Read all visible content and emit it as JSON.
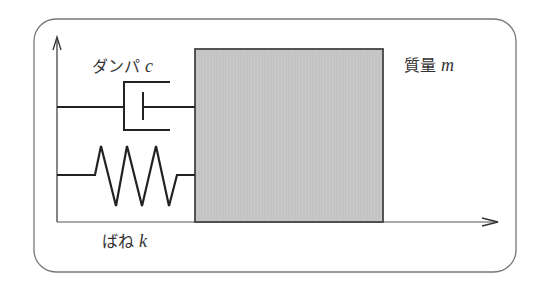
{
  "diagram": {
    "damper": {
      "label": "ダンパ",
      "symbol": "c"
    },
    "spring": {
      "label": "ばね",
      "symbol": "k"
    },
    "mass": {
      "label": "質量",
      "symbol": "m"
    },
    "colors": {
      "mass_fill": "#c8c8c8",
      "line": "#222222",
      "frame": "#666666"
    }
  }
}
